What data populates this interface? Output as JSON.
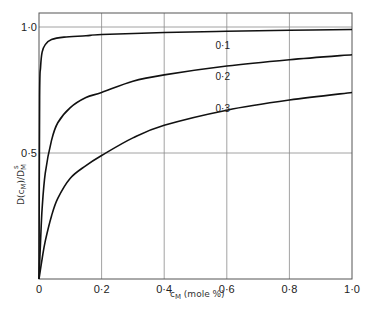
{
  "chart_data": {
    "type": "line",
    "title": "",
    "xlabel": "c_M (mole %)",
    "ylabel": "D(c_M)/D_M^s",
    "xlim": [
      0,
      1.0
    ],
    "ylim": [
      0,
      1.0
    ],
    "grid": true,
    "x_ticks": [
      "0",
      "0·2",
      "0·4",
      "0·6",
      "0·8",
      "1·0"
    ],
    "y_ticks": [
      "0·5",
      "1·0"
    ],
    "legend": "inline curve labels",
    "series": [
      {
        "name": "0·1",
        "x": [
          0,
          0.002,
          0.005,
          0.01,
          0.02,
          0.04,
          0.08,
          0.15,
          0.2,
          0.4,
          0.6,
          0.8,
          1.0
        ],
        "values": [
          0,
          0.72,
          0.84,
          0.9,
          0.93,
          0.95,
          0.96,
          0.965,
          0.97,
          0.978,
          0.983,
          0.987,
          0.99
        ]
      },
      {
        "name": "0·2",
        "x": [
          0,
          0.005,
          0.01,
          0.02,
          0.04,
          0.06,
          0.1,
          0.15,
          0.2,
          0.3,
          0.4,
          0.6,
          0.8,
          1.0
        ],
        "values": [
          0,
          0.15,
          0.28,
          0.42,
          0.55,
          0.62,
          0.68,
          0.72,
          0.74,
          0.785,
          0.81,
          0.845,
          0.87,
          0.89
        ]
      },
      {
        "name": "0·3",
        "x": [
          0,
          0.01,
          0.02,
          0.04,
          0.06,
          0.1,
          0.15,
          0.2,
          0.3,
          0.4,
          0.6,
          0.8,
          1.0
        ],
        "values": [
          0,
          0.08,
          0.15,
          0.25,
          0.32,
          0.4,
          0.45,
          0.49,
          0.56,
          0.61,
          0.67,
          0.71,
          0.74
        ]
      }
    ],
    "curve_labels": [
      {
        "text": "0·1",
        "x": 0.6,
        "y": 0.93
      },
      {
        "text": "0·2",
        "x": 0.6,
        "y": 0.805
      },
      {
        "text": "0·3",
        "x": 0.6,
        "y": 0.68
      }
    ]
  },
  "labels": {
    "xlabel_main": "c",
    "xlabel_sub": "M",
    "xlabel_rest": " (mole %)",
    "ylabel": "D(c",
    "ylabel_sub": "M",
    "ylabel_mid": ")/D",
    "ylabel_sub2": "M",
    "ylabel_sup2": "s"
  }
}
